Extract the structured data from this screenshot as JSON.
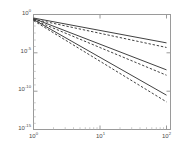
{
  "chart_data": {
    "type": "line",
    "title": "",
    "xlabel": "",
    "ylabel": "",
    "scale": {
      "x": "log",
      "y": "log"
    },
    "grid": false,
    "legend": null,
    "xlim": [
      1,
      100
    ],
    "ylim": [
      1e-15,
      1
    ],
    "xticks": [
      1,
      10,
      100
    ],
    "xtick_labels": [
      "10",
      "10",
      "10"
    ],
    "xtick_exponents": [
      "0",
      "1",
      "2"
    ],
    "yticks": [
      1,
      1e-05,
      1e-10,
      1e-15
    ],
    "ytick_labels": [
      "10",
      "10",
      "10",
      "10"
    ],
    "ytick_exponents": [
      "0",
      "-5",
      "-10",
      "-15"
    ],
    "series": [
      {
        "name": "curve-1-solid",
        "style": "solid",
        "color": "#2b2b2b",
        "x": [
          1,
          100
        ],
        "y": [
          0.35,
          0.0002
        ]
      },
      {
        "name": "curve-1-dashed",
        "style": "dashed",
        "color": "#2b2b2b",
        "x": [
          1,
          100
        ],
        "y": [
          0.25,
          5e-05
        ]
      },
      {
        "name": "curve-2-solid",
        "style": "solid",
        "color": "#2b2b2b",
        "x": [
          1,
          100
        ],
        "y": [
          0.3,
          6e-08
        ]
      },
      {
        "name": "curve-2-dashed",
        "style": "dashed",
        "color": "#2b2b2b",
        "x": [
          1,
          100
        ],
        "y": [
          0.2,
          1.2e-08
        ]
      },
      {
        "name": "curve-3-solid",
        "style": "solid",
        "color": "#2b2b2b",
        "x": [
          1,
          100
        ],
        "y": [
          0.22,
          3e-11
        ]
      },
      {
        "name": "curve-3-dashed",
        "style": "dashed",
        "color": "#2b2b2b",
        "x": [
          1,
          100
        ],
        "y": [
          0.16,
          4e-12
        ]
      }
    ],
    "axes_color": "#8a8a8a",
    "tick_label_color": "#4a4a4a"
  },
  "ytick_labels": [
    {
      "mantissa": "10",
      "exp": "0"
    },
    {
      "mantissa": "10",
      "exp": "-5"
    },
    {
      "mantissa": "10",
      "exp": "-10"
    },
    {
      "mantissa": "10",
      "exp": "-15"
    }
  ],
  "xtick_labels": [
    {
      "mantissa": "10",
      "exp": "0"
    },
    {
      "mantissa": "10",
      "exp": "1"
    },
    {
      "mantissa": "10",
      "exp": "2"
    }
  ]
}
